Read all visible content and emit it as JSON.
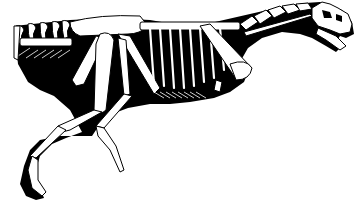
{
  "figure": {
    "type": "skeletal-reconstruction",
    "view": "left lateral, running pose",
    "colors": {
      "silhouette": "#000000",
      "bones": "#ffffff",
      "background": "#ffffff"
    },
    "parts": [
      "skull",
      "neck-vertebrae",
      "dorsal-vertebrae",
      "ribs",
      "gastralia",
      "pectoral-girdle",
      "forelimb",
      "pelvis",
      "femur",
      "tibia",
      "metatarsals",
      "feet",
      "tail"
    ]
  }
}
